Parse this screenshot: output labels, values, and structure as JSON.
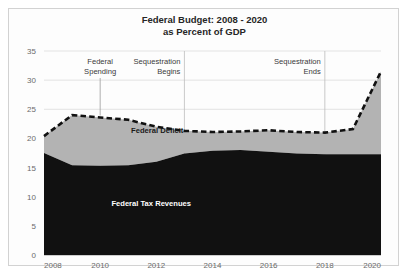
{
  "chart_data": {
    "type": "area",
    "title": "Federal Budget: 2008 - 2020",
    "subtitle": "as Percent of GDP",
    "xlabel": "",
    "ylabel": "",
    "ylim": [
      0,
      35
    ],
    "xlim": [
      2008,
      2020
    ],
    "yticks": [
      0,
      5,
      10,
      15,
      20,
      25,
      30,
      35
    ],
    "xticks": [
      2008,
      2010,
      2012,
      2014,
      2016,
      2018,
      2020
    ],
    "grid": true,
    "legend": "inline-labels",
    "x": [
      2008,
      2009,
      2010,
      2011,
      2012,
      2013,
      2014,
      2015,
      2016,
      2017,
      2018,
      2019,
      2020
    ],
    "series": [
      {
        "name": "Federal Tax Revenues",
        "style": "filled-area-black",
        "color": "#111111",
        "values": [
          17.5,
          15.4,
          15.3,
          15.4,
          16.0,
          17.4,
          17.9,
          18.0,
          17.7,
          17.4,
          17.3,
          17.3,
          17.3
        ]
      },
      {
        "name": "Federal Spending",
        "style": "dashed-line-black",
        "color": "#111111",
        "values": [
          20.4,
          24.0,
          23.6,
          23.2,
          22.0,
          21.3,
          21.1,
          21.2,
          21.4,
          21.1,
          21.0,
          21.6,
          31.5
        ]
      },
      {
        "name": "Federal Deficit",
        "style": "filled-area-gray",
        "color": "#b3b3b3",
        "description": "area between Federal Tax Revenues and Federal Spending"
      }
    ],
    "annotations": [
      {
        "id": "federal-spending",
        "label_line1": "Federal",
        "label_line2": "Spending",
        "x": 2010,
        "leader_to_y": 23.6,
        "align": "middle"
      },
      {
        "id": "sequestration-begins",
        "label_line1": "Sequestration",
        "label_line2": "Begins",
        "x": 2013,
        "align": "end",
        "vertical_line": true
      },
      {
        "id": "sequestration-ends",
        "label_line1": "Sequestration",
        "label_line2": "Ends",
        "x": 2018,
        "align": "end",
        "vertical_line": true
      }
    ],
    "inline_labels": [
      {
        "id": "federal-deficit",
        "text": "Federal Deficit",
        "x": 2011.1,
        "y": 21.0,
        "color": "#1a1a1a"
      },
      {
        "id": "federal-tax-revenues",
        "text": "Federal Tax Revenues",
        "x": 2010.4,
        "y": 8.4,
        "color": "#ffffff"
      }
    ]
  }
}
